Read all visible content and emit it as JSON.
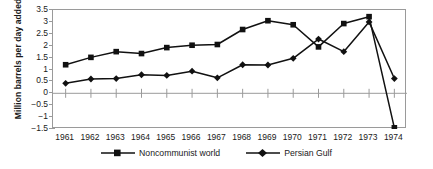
{
  "chart_data": {
    "type": "line",
    "title": "",
    "xlabel": "",
    "ylabel": "Million barrels per day added",
    "categories": [
      "1961",
      "1962",
      "1963",
      "1964",
      "1965",
      "1966",
      "1967",
      "1968",
      "1969",
      "1970",
      "1971",
      "1972",
      "1973",
      "1974"
    ],
    "x": [
      1961,
      1962,
      1963,
      1964,
      1965,
      1966,
      1967,
      1968,
      1969,
      1970,
      1971,
      1972,
      1973,
      1974
    ],
    "series": [
      {
        "name": "Noncommunist world",
        "marker": "square",
        "values": [
          1.2,
          1.51,
          1.75,
          1.67,
          1.92,
          2.02,
          2.05,
          2.68,
          3.05,
          2.88,
          1.95,
          2.93,
          3.22,
          -1.45
        ]
      },
      {
        "name": "Persian Gulf",
        "marker": "diamond",
        "values": [
          0.42,
          0.6,
          0.62,
          0.78,
          0.75,
          0.93,
          0.65,
          1.2,
          1.19,
          1.47,
          2.28,
          1.75,
          3.0,
          0.62
        ]
      }
    ],
    "ylim": [
      -1.5,
      3.5
    ],
    "ytick_labels": [
      "3.5",
      "3",
      "2.5",
      "2",
      "1.5",
      "1",
      "0.5",
      "0",
      "−0.5",
      "−1",
      "−1.5"
    ],
    "ytick_values": [
      3.5,
      3,
      2.5,
      2,
      1.5,
      1,
      0.5,
      0,
      -0.5,
      -1,
      -1.5
    ],
    "grid": false,
    "zero_line": true,
    "legend_position": "bottom",
    "colors": {
      "line": "#111111",
      "frame": "#9a9a9a",
      "zero_line": "#9a9a9a",
      "text": "#1a1a1a",
      "background": "#ffffff"
    }
  },
  "legend": {
    "items": [
      {
        "label": "Noncommunist world",
        "marker": "square-marker-icon"
      },
      {
        "label": "Persian Gulf",
        "marker": "diamond-marker-icon"
      }
    ]
  },
  "axis": {
    "y_title": "Million barrels per day added"
  }
}
